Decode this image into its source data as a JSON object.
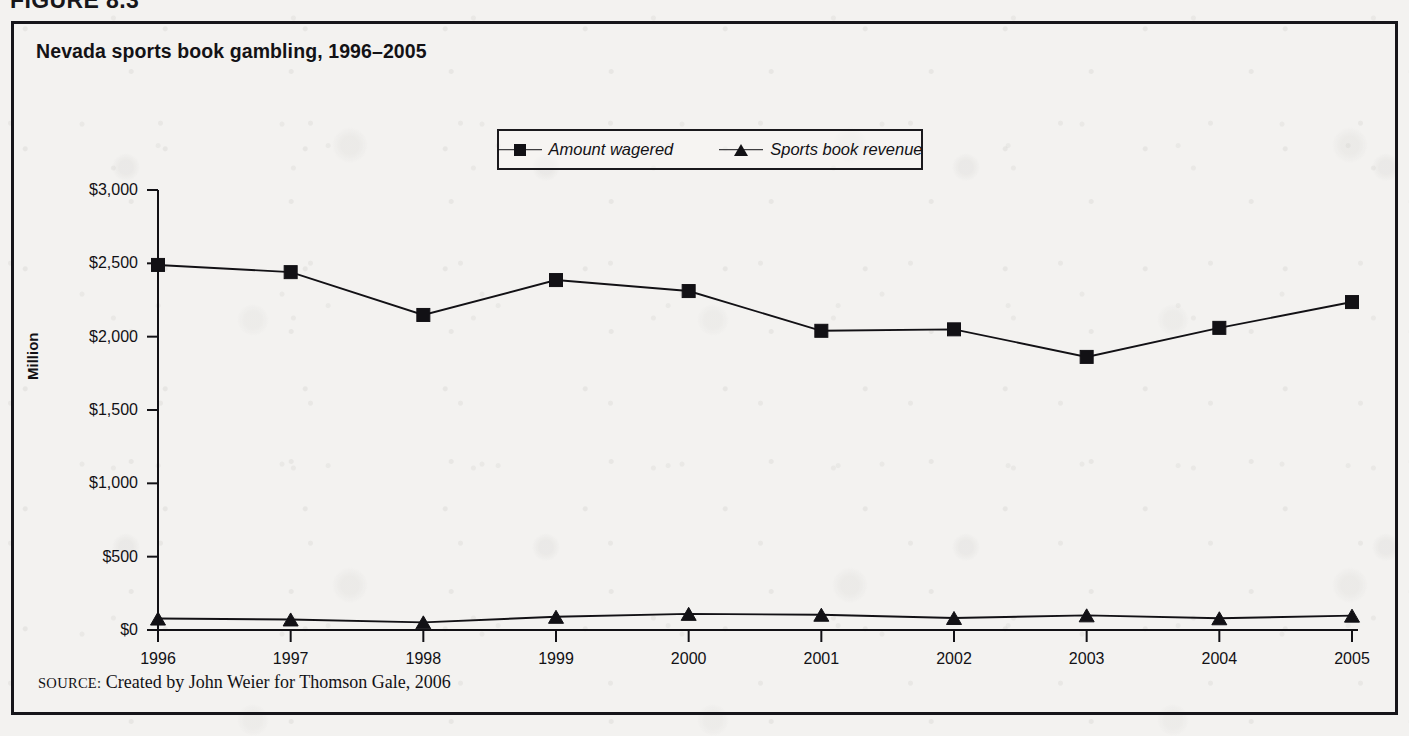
{
  "figure": {
    "label": "FIGURE 8.3",
    "frame_color": "#16151a",
    "background_color": "#f3f2f0"
  },
  "chart": {
    "title": "Nevada sports book gambling, 1996–2005",
    "source_prefix": "SOURCE:",
    "source_text": "Created by John Weier for Thomson Gale, 2006"
  },
  "legend": {
    "entries": [
      {
        "label": "Amount wagered",
        "marker": "square-marker-icon"
      },
      {
        "label": "Sports book revenue",
        "marker": "triangle-marker-icon"
      }
    ]
  },
  "chart_data": {
    "type": "line",
    "title": "Nevada sports book gambling, 1996–2005",
    "xlabel": "",
    "ylabel": "Million",
    "categories": [
      "1996",
      "1997",
      "1998",
      "1999",
      "2000",
      "2001",
      "2002",
      "2003",
      "2004",
      "2005"
    ],
    "x": [
      1996,
      1997,
      1998,
      1999,
      2000,
      2001,
      2002,
      2003,
      2004,
      2005
    ],
    "series": [
      {
        "name": "Amount wagered",
        "marker": "square",
        "values": [
          2489,
          2440,
          2148,
          2386,
          2311,
          2040,
          2050,
          1862,
          2060,
          2236
        ]
      },
      {
        "name": "Sports book revenue",
        "marker": "triangle",
        "values": [
          78,
          72,
          52,
          90,
          110,
          104,
          82,
          100,
          80,
          98
        ]
      }
    ],
    "ylim": [
      0,
      3000
    ],
    "ytick_values": [
      0,
      500,
      1000,
      1500,
      2000,
      2500,
      3000
    ],
    "ytick_labels": [
      "$0",
      "$500",
      "$1,000",
      "$1,500",
      "$2,000",
      "$2,500",
      "$3,000"
    ],
    "grid": false,
    "legend_position": "top-center",
    "line_color": "#121115",
    "marker_color": "#121115"
  }
}
